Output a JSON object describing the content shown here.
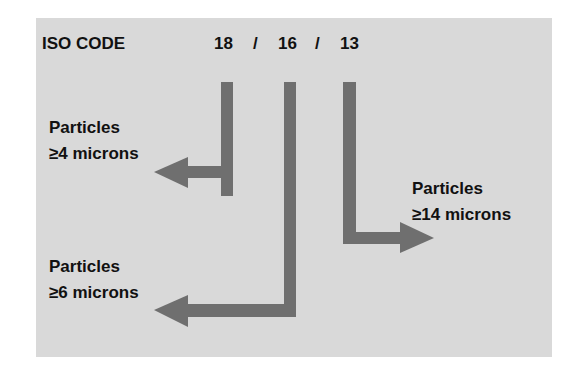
{
  "title": "ISO CODE",
  "code": {
    "values": [
      "18",
      "16",
      "13"
    ],
    "separator": "/"
  },
  "labels": [
    {
      "line1": "Particles",
      "line2": "≥4 microns"
    },
    {
      "line1": "Particles",
      "line2": "≥6 microns"
    },
    {
      "line1": "Particles",
      "line2": "≥14 microns"
    }
  ],
  "colors": {
    "background": "#d9d9d9",
    "arrow": "#6f6f6f",
    "text": "#111111"
  }
}
